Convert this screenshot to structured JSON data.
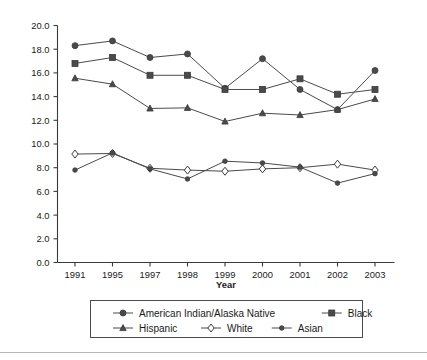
{
  "chart_data": {
    "type": "line",
    "title": "",
    "xlabel": "Year",
    "ylabel": "",
    "categories": [
      "1991",
      "1995",
      "1997",
      "1998",
      "1999",
      "2000",
      "2001",
      "2002",
      "2003"
    ],
    "ylim": [
      0.0,
      20.0
    ],
    "ytick_step": 2.0,
    "yticks": [
      "0.0",
      "2.0",
      "4.0",
      "6.0",
      "8.0",
      "10.0",
      "12.0",
      "14.0",
      "16.0",
      "18.0",
      "20.0"
    ],
    "grid": false,
    "legend_position": "bottom",
    "series": [
      {
        "name": "American Indian/Alaska Native",
        "marker": "circle-filled",
        "values": [
          18.3,
          18.7,
          17.3,
          17.6,
          14.7,
          17.2,
          14.6,
          12.9,
          16.2
        ]
      },
      {
        "name": "Black",
        "marker": "square-filled",
        "values": [
          16.8,
          17.3,
          15.8,
          15.8,
          14.6,
          14.6,
          15.5,
          14.2,
          14.6
        ]
      },
      {
        "name": "Hispanic",
        "marker": "triangle-filled",
        "values": [
          15.55,
          15.05,
          13.0,
          13.05,
          11.9,
          12.6,
          12.45,
          12.9,
          13.8
        ]
      },
      {
        "name": "White",
        "marker": "diamond-open",
        "values": [
          9.15,
          9.2,
          7.95,
          7.8,
          7.7,
          7.9,
          8.0,
          8.3,
          7.8
        ]
      },
      {
        "name": "Asian",
        "marker": "circle-small-filled",
        "values": [
          7.8,
          9.25,
          7.9,
          7.05,
          8.55,
          8.4,
          8.05,
          6.7,
          7.5
        ]
      }
    ]
  },
  "axis": {
    "x_title": "Year"
  },
  "legend": {
    "row1": [
      {
        "label": "American Indian/Alaska Native",
        "marker": "circle-filled"
      },
      {
        "label": "Black",
        "marker": "square-filled"
      }
    ],
    "row2": [
      {
        "label": "Hispanic",
        "marker": "triangle-filled"
      },
      {
        "label": "White",
        "marker": "diamond-open"
      },
      {
        "label": "Asian",
        "marker": "circle-small-filled"
      }
    ]
  },
  "colors": {
    "line": "#4a4a4a",
    "axis": "#3a3a3a",
    "background": "#ffffff",
    "rule": "#b8b8b8"
  }
}
